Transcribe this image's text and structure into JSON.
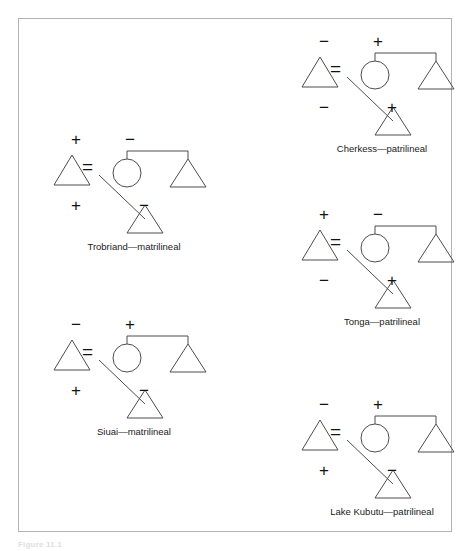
{
  "figure": {
    "caption": "Figure 11.1",
    "header_bleed": "",
    "frame_color": "#b3b3b3",
    "line_color": "#4d4d4d",
    "background": "#ffffff"
  },
  "legend": {
    "male_symbol": "triangle",
    "female_symbol": "circle",
    "marriage_symbol": "=",
    "positive": "+",
    "negative": "−"
  },
  "diagrams": [
    {
      "id": "trobriand",
      "label": "Trobriand—matrilineal",
      "descent": "matrilineal",
      "society": "Trobriand",
      "signs": {
        "top_left": "+",
        "top_right": "−",
        "bottom_left": "+",
        "bottom_right": "−"
      },
      "marriage": "="
    },
    {
      "id": "cherkess",
      "label": "Cherkess—patrilineal",
      "descent": "patrilineal",
      "society": "Cherkess",
      "signs": {
        "top_left": "−",
        "top_right": "+",
        "bottom_left": "−",
        "bottom_right": "+"
      },
      "marriage": "="
    },
    {
      "id": "tonga",
      "label": "Tonga—patrilineal",
      "descent": "patrilineal",
      "society": "Tonga",
      "signs": {
        "top_left": "+",
        "top_right": "−",
        "bottom_left": "−",
        "bottom_right": "+"
      },
      "marriage": "="
    },
    {
      "id": "siuai",
      "label": "Siuai—matrilineal",
      "descent": "matrilineal",
      "society": "Siuai",
      "signs": {
        "top_left": "−",
        "top_right": "+",
        "bottom_left": "+",
        "bottom_right": "−"
      },
      "marriage": "="
    },
    {
      "id": "lakekubutu",
      "label": "Lake Kubutu—patrilineal",
      "descent": "patrilineal",
      "society": "Lake Kubutu",
      "signs": {
        "top_left": "−",
        "top_right": "+",
        "bottom_left": "+",
        "bottom_right": "−"
      },
      "marriage": "="
    }
  ]
}
